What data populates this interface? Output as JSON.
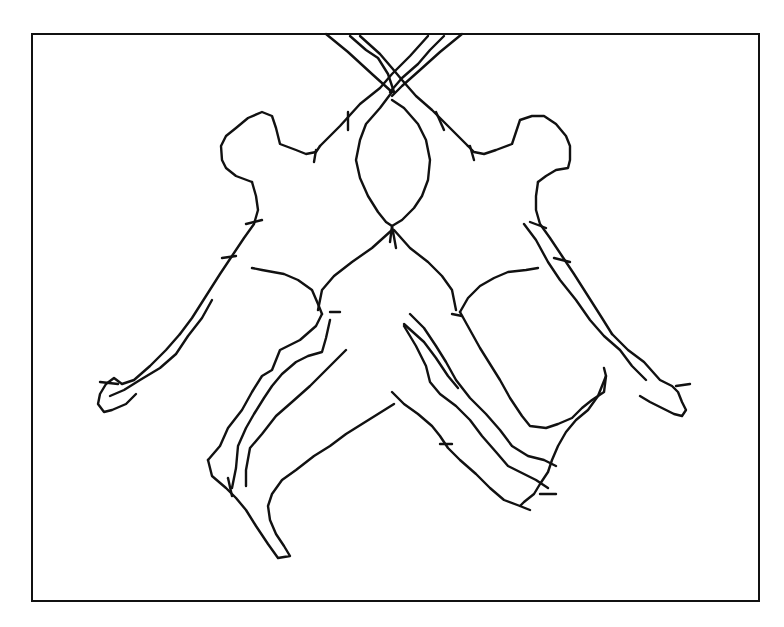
{
  "figure": {
    "frame": {
      "stroke_color": "#111111",
      "background": "#ffffff"
    },
    "figures": [
      {
        "id": "left-figure",
        "orientation": "arms raised, legs kicking down-left"
      },
      {
        "id": "right-figure",
        "orientation": "mirror image, legs kicking down-right"
      }
    ],
    "caption": ""
  }
}
